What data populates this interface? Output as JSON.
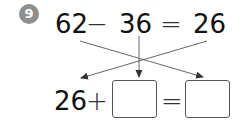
{
  "problem": {
    "number": "9",
    "badge_color": "#8e8e8e"
  },
  "top_equation": {
    "minuend": "62",
    "minus": "−",
    "subtrahend": "36",
    "equals": "=",
    "difference": "26"
  },
  "bottom_equation": {
    "addend": "26",
    "plus": "+",
    "blank_1": "",
    "equals": "=",
    "blank_2": ""
  },
  "arrows": [
    {
      "from": "62",
      "to": "blank_2"
    },
    {
      "from": "36",
      "to": "blank_1"
    },
    {
      "from": "26",
      "to": "addend"
    }
  ]
}
